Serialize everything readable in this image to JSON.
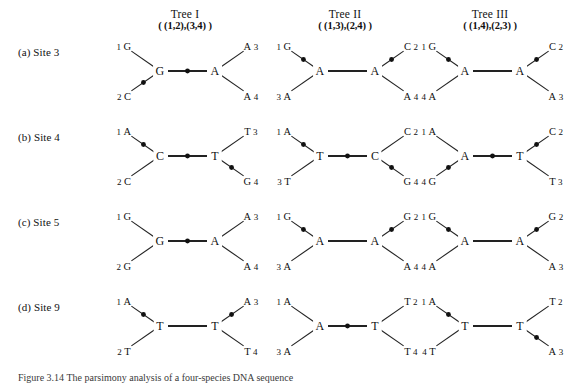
{
  "figure": {
    "caption": "Figure 3.14  The parsimony analysis of a four-species DNA sequence"
  },
  "columns": [
    {
      "name": "Tree I",
      "partition": "( (1,2),(3,4) )"
    },
    {
      "name": "Tree II",
      "partition": "( (1,3),(2,4) )"
    },
    {
      "name": "Tree III",
      "partition": "( (1,4),(2,3) )"
    }
  ],
  "rows": [
    {
      "key": "a",
      "label": "(a)  Site 3"
    },
    {
      "key": "b",
      "label": "(b)  Site 4"
    },
    {
      "key": "c",
      "label": "(c)  Site 5"
    },
    {
      "key": "d",
      "label": "(d)  Site 9"
    }
  ],
  "trees": [
    {
      "row": "a",
      "col": 0,
      "tips": {
        "upper_left": {
          "index": "1",
          "base": "G",
          "order": "index-first"
        },
        "lower_left": {
          "index": "2",
          "base": "C",
          "order": "index-first"
        },
        "upper_right": {
          "index": "3",
          "base": "A",
          "order": "base-first"
        },
        "lower_right": {
          "index": "4",
          "base": "A",
          "order": "base-first"
        }
      },
      "nodes": {
        "left": "G",
        "right": "A"
      },
      "changes": [
        "lower_left",
        "internal"
      ]
    },
    {
      "row": "a",
      "col": 1,
      "tips": {
        "upper_left": {
          "index": "1",
          "base": "G",
          "order": "index-first"
        },
        "lower_left": {
          "index": "3",
          "base": "A",
          "order": "index-first"
        },
        "upper_right": {
          "index": "2",
          "base": "C",
          "order": "base-first"
        },
        "lower_right": {
          "index": "4",
          "base": "A",
          "order": "base-first"
        }
      },
      "nodes": {
        "left": "A",
        "right": "A"
      },
      "changes": [
        "upper_left",
        "upper_right"
      ]
    },
    {
      "row": "a",
      "col": 2,
      "tips": {
        "upper_left": {
          "index": "1",
          "base": "G",
          "order": "index-first"
        },
        "lower_left": {
          "index": "4",
          "base": "A",
          "order": "index-first"
        },
        "upper_right": {
          "index": "2",
          "base": "C",
          "order": "base-first"
        },
        "lower_right": {
          "index": "3",
          "base": "A",
          "order": "base-first"
        }
      },
      "nodes": {
        "left": "A",
        "right": "A"
      },
      "changes": [
        "upper_left",
        "upper_right"
      ]
    },
    {
      "row": "b",
      "col": 0,
      "tips": {
        "upper_left": {
          "index": "1",
          "base": "A",
          "order": "index-first"
        },
        "lower_left": {
          "index": "2",
          "base": "C",
          "order": "index-first"
        },
        "upper_right": {
          "index": "3",
          "base": "T",
          "order": "base-first"
        },
        "lower_right": {
          "index": "4",
          "base": "G",
          "order": "base-first"
        }
      },
      "nodes": {
        "left": "C",
        "right": "T"
      },
      "changes": [
        "upper_left",
        "internal",
        "lower_right"
      ]
    },
    {
      "row": "b",
      "col": 1,
      "tips": {
        "upper_left": {
          "index": "1",
          "base": "A",
          "order": "index-first"
        },
        "lower_left": {
          "index": "3",
          "base": "T",
          "order": "index-first"
        },
        "upper_right": {
          "index": "2",
          "base": "C",
          "order": "base-first"
        },
        "lower_right": {
          "index": "4",
          "base": "G",
          "order": "base-first"
        }
      },
      "nodes": {
        "left": "T",
        "right": "C"
      },
      "changes": [
        "upper_left",
        "internal",
        "lower_right"
      ]
    },
    {
      "row": "b",
      "col": 2,
      "tips": {
        "upper_left": {
          "index": "1",
          "base": "A",
          "order": "index-first"
        },
        "lower_left": {
          "index": "4",
          "base": "G",
          "order": "index-first"
        },
        "upper_right": {
          "index": "2",
          "base": "C",
          "order": "base-first"
        },
        "lower_right": {
          "index": "3",
          "base": "T",
          "order": "base-first"
        }
      },
      "nodes": {
        "left": "A",
        "right": "T"
      },
      "changes": [
        "lower_left",
        "internal",
        "upper_right"
      ]
    },
    {
      "row": "c",
      "col": 0,
      "tips": {
        "upper_left": {
          "index": "1",
          "base": "G",
          "order": "index-first"
        },
        "lower_left": {
          "index": "2",
          "base": "G",
          "order": "index-first"
        },
        "upper_right": {
          "index": "3",
          "base": "A",
          "order": "base-first"
        },
        "lower_right": {
          "index": "4",
          "base": "A",
          "order": "base-first"
        }
      },
      "nodes": {
        "left": "G",
        "right": "A"
      },
      "changes": [
        "internal"
      ]
    },
    {
      "row": "c",
      "col": 1,
      "tips": {
        "upper_left": {
          "index": "1",
          "base": "G",
          "order": "index-first"
        },
        "lower_left": {
          "index": "3",
          "base": "A",
          "order": "index-first"
        },
        "upper_right": {
          "index": "2",
          "base": "G",
          "order": "base-first"
        },
        "lower_right": {
          "index": "4",
          "base": "A",
          "order": "base-first"
        }
      },
      "nodes": {
        "left": "A",
        "right": "A"
      },
      "changes": [
        "upper_left",
        "upper_right"
      ]
    },
    {
      "row": "c",
      "col": 2,
      "tips": {
        "upper_left": {
          "index": "1",
          "base": "G",
          "order": "index-first"
        },
        "lower_left": {
          "index": "4",
          "base": "A",
          "order": "index-first"
        },
        "upper_right": {
          "index": "2",
          "base": "G",
          "order": "base-first"
        },
        "lower_right": {
          "index": "3",
          "base": "A",
          "order": "base-first"
        }
      },
      "nodes": {
        "left": "A",
        "right": "A"
      },
      "changes": [
        "upper_left",
        "upper_right"
      ]
    },
    {
      "row": "d",
      "col": 0,
      "tips": {
        "upper_left": {
          "index": "1",
          "base": "A",
          "order": "index-first"
        },
        "lower_left": {
          "index": "2",
          "base": "T",
          "order": "index-first"
        },
        "upper_right": {
          "index": "3",
          "base": "A",
          "order": "base-first"
        },
        "lower_right": {
          "index": "4",
          "base": "T",
          "order": "base-first"
        }
      },
      "nodes": {
        "left": "T",
        "right": "T"
      },
      "changes": [
        "upper_left",
        "upper_right"
      ]
    },
    {
      "row": "d",
      "col": 1,
      "tips": {
        "upper_left": {
          "index": "1",
          "base": "A",
          "order": "index-first"
        },
        "lower_left": {
          "index": "3",
          "base": "A",
          "order": "index-first"
        },
        "upper_right": {
          "index": "2",
          "base": "T",
          "order": "base-first"
        },
        "lower_right": {
          "index": "4",
          "base": "T",
          "order": "base-first"
        }
      },
      "nodes": {
        "left": "A",
        "right": "T"
      },
      "changes": [
        "internal"
      ]
    },
    {
      "row": "d",
      "col": 2,
      "tips": {
        "upper_left": {
          "index": "1",
          "base": "A",
          "order": "index-first"
        },
        "lower_left": {
          "index": "4",
          "base": "T",
          "order": "index-first"
        },
        "upper_right": {
          "index": "2",
          "base": "T",
          "order": "base-first"
        },
        "lower_right": {
          "index": "3",
          "base": "A",
          "order": "base-first"
        }
      },
      "nodes": {
        "left": "T",
        "right": "T"
      },
      "changes": [
        "upper_left",
        "lower_right"
      ]
    }
  ],
  "layout": {
    "column_x": [
      105,
      265,
      410
    ],
    "row_y": [
      40,
      125,
      210,
      295
    ],
    "header_y": 8,
    "tree_geometry": {
      "left_node_x": 55,
      "right_node_x": 110,
      "node_y": 31,
      "tip_dx": 36,
      "tip_dy": 25
    }
  },
  "colors": {
    "ink": "#111111",
    "branch": "#222222",
    "background": "#ffffff"
  }
}
